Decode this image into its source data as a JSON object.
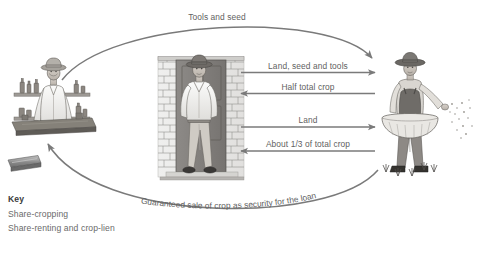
{
  "diagram": {
    "arrow_color": "#7a7a7a",
    "text_color": "#5f5f5f",
    "key_title_color": "#3b3b3b",
    "background": "#ffffff"
  },
  "actors": {
    "merchant": {
      "name": "merchant-shopkeeper",
      "caption": ""
    },
    "landlord": {
      "name": "landlord-in-doorway",
      "caption": ""
    },
    "farmer": {
      "name": "farmer-sowing-seed",
      "caption": ""
    }
  },
  "arcs": {
    "top": {
      "label": "Tools and seed",
      "from": "merchant",
      "to": "farmer",
      "direction": "right"
    },
    "bottom": {
      "label": "Guaranteed sale of crop as security for the loan",
      "from": "farmer",
      "to": "merchant",
      "direction": "left"
    }
  },
  "flows": [
    {
      "label": "Land, seed and tools",
      "direction": "right",
      "from": "landlord",
      "to": "farmer"
    },
    {
      "label": "Half total crop",
      "direction": "left",
      "from": "farmer",
      "to": "landlord"
    },
    {
      "label": "Land",
      "direction": "right",
      "from": "landlord",
      "to": "farmer"
    },
    {
      "label": "About 1/3 of total crop",
      "direction": "left",
      "from": "farmer",
      "to": "landlord"
    }
  ],
  "key": {
    "title": "Key",
    "items": [
      "Share-cropping",
      "Share-renting and crop-lien"
    ]
  }
}
